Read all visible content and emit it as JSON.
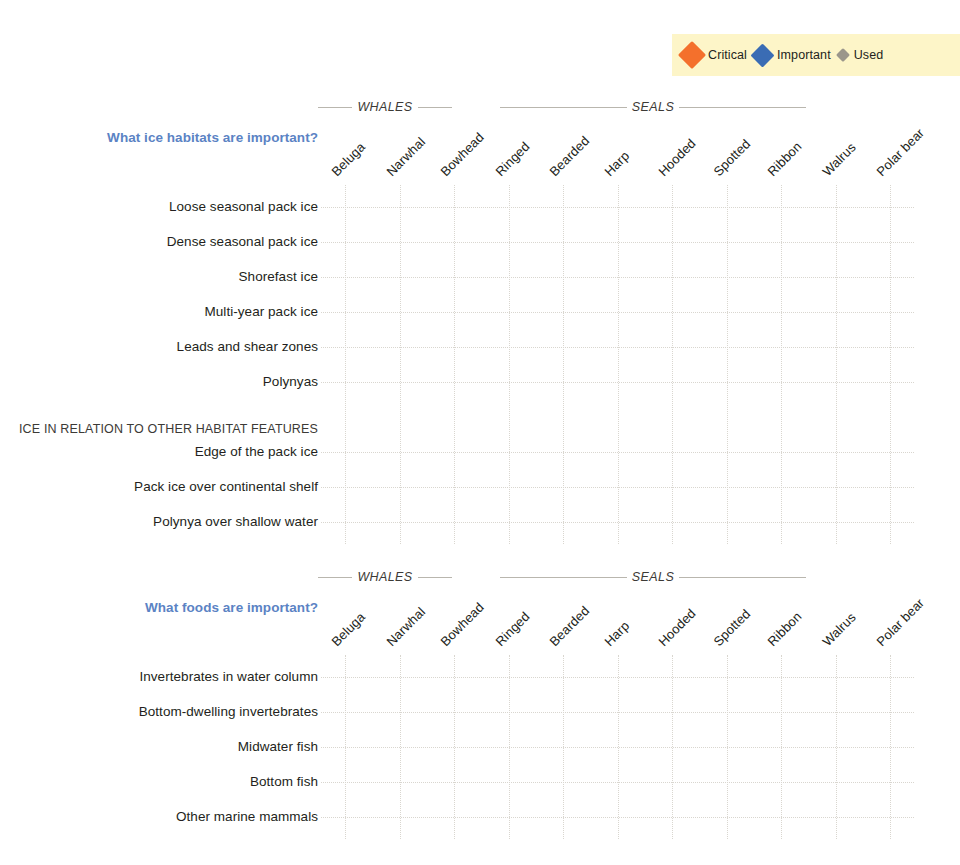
{
  "legend": {
    "items": [
      {
        "key": "critical",
        "label": "Critical",
        "color": "#f4702c",
        "icon": "diamond-icon"
      },
      {
        "key": "important",
        "label": "Important",
        "color": "#3a6cb4",
        "icon": "diamond-icon"
      },
      {
        "key": "used",
        "label": "Used",
        "color": "#9b968b",
        "icon": "diamond-icon"
      }
    ],
    "background": "#fdf5c8"
  },
  "chart_data": [
    {
      "type": "heatmap",
      "id": "ice",
      "title": "What ice habitats are important?",
      "xlabel": "",
      "ylabel": "",
      "grid": true,
      "legend_position": "top-right",
      "column_groups": [
        {
          "name": "WHALES",
          "columns": [
            "Beluga",
            "Narwhal",
            "Bowhead"
          ]
        },
        {
          "name": "SEALS",
          "columns": [
            "Ringed",
            "Bearded",
            "Harp",
            "Hooded",
            "Spotted",
            "Ribbon"
          ]
        }
      ],
      "categories": [
        "Beluga",
        "Narwhal",
        "Bowhead",
        "Ringed",
        "Bearded",
        "Harp",
        "Hooded",
        "Spotted",
        "Ribbon",
        "Walrus",
        "Polar bear"
      ],
      "rows": [
        {
          "label": "Loose seasonal pack ice",
          "section": null,
          "values": [
            "critical",
            "used",
            "used",
            "important",
            "important",
            "important",
            "important",
            "important",
            "critical",
            "important",
            "important"
          ]
        },
        {
          "label": "Dense seasonal pack ice",
          "section": null,
          "values": [
            null,
            "critical",
            "important",
            "important",
            "critical",
            "critical",
            "important",
            "used",
            "used",
            "critical",
            "critical"
          ]
        },
        {
          "label": "Shorefast ice",
          "section": null,
          "values": [
            null,
            null,
            null,
            "critical",
            "used",
            null,
            null,
            null,
            null,
            null,
            "critical"
          ]
        },
        {
          "label": "Multi-year pack ice",
          "section": null,
          "values": [
            "used",
            null,
            "used",
            "used",
            "used",
            null,
            null,
            null,
            null,
            "used",
            "important"
          ]
        },
        {
          "label": "Leads and shear zones",
          "section": null,
          "values": [
            "important",
            "critical",
            "important",
            "used",
            "important",
            null,
            null,
            null,
            null,
            "used",
            "important"
          ]
        },
        {
          "label": "Polynyas",
          "section": null,
          "values": [
            "critical",
            "important",
            "important",
            "used",
            null,
            null,
            null,
            null,
            null,
            "important",
            "used"
          ]
        },
        {
          "label": "Edge of the pack ice",
          "section": "ICE IN RELATION TO OTHER HABITAT FEATURES",
          "values": [
            "important",
            "important",
            "important",
            "used",
            null,
            null,
            null,
            "important",
            "important",
            null,
            "used"
          ]
        },
        {
          "label": "Pack ice over continental shelf",
          "section": null,
          "values": [
            null,
            "used",
            null,
            "used",
            "important",
            "critical",
            "important",
            "important",
            "important",
            "important",
            "used"
          ]
        },
        {
          "label": "Polynya over shallow water",
          "section": null,
          "values": [
            "critical",
            null,
            null,
            null,
            null,
            null,
            null,
            null,
            null,
            "used",
            null
          ]
        }
      ]
    },
    {
      "type": "heatmap",
      "id": "food",
      "title": "What foods are important?",
      "xlabel": "",
      "ylabel": "",
      "grid": true,
      "legend_position": "top-right",
      "column_groups": [
        {
          "name": "WHALES",
          "columns": [
            "Beluga",
            "Narwhal",
            "Bowhead"
          ]
        },
        {
          "name": "SEALS",
          "columns": [
            "Ringed",
            "Bearded",
            "Harp",
            "Hooded",
            "Spotted",
            "Ribbon"
          ]
        }
      ],
      "categories": [
        "Beluga",
        "Narwhal",
        "Bowhead",
        "Ringed",
        "Bearded",
        "Harp",
        "Hooded",
        "Spotted",
        "Ribbon",
        "Walrus",
        "Polar bear"
      ],
      "rows": [
        {
          "label": "Invertebrates in water column",
          "section": null,
          "values": [
            "used",
            "used",
            "critical",
            "important",
            null,
            "used",
            null,
            "used",
            "used",
            null,
            null
          ]
        },
        {
          "label": "Bottom-dwelling invertebrates",
          "section": null,
          "values": [
            "used",
            null,
            "important",
            "used",
            "critical",
            "used",
            null,
            "used",
            "used",
            "critical",
            null
          ]
        },
        {
          "label": "Midwater fish",
          "section": null,
          "values": [
            "critical",
            "used",
            null,
            "critical",
            "used",
            "critical",
            "important",
            "critical",
            "important",
            null,
            null
          ]
        },
        {
          "label": "Bottom fish",
          "section": null,
          "values": [
            "used",
            "critical",
            null,
            "used",
            "important",
            null,
            "critical",
            "used",
            "important",
            null,
            null
          ]
        },
        {
          "label": "Other marine mammals",
          "section": null,
          "values": [
            null,
            null,
            null,
            null,
            null,
            null,
            null,
            null,
            null,
            "used",
            "critical"
          ]
        }
      ]
    }
  ]
}
